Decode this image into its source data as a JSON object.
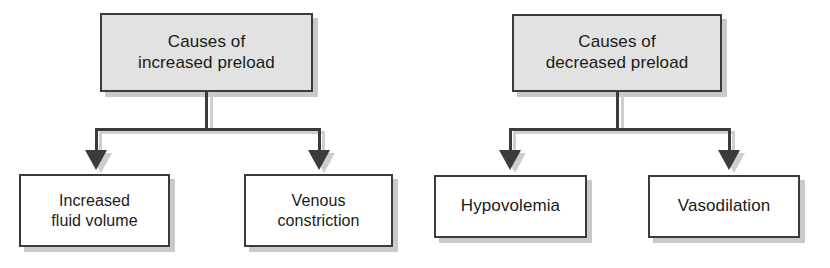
{
  "diagram": {
    "type": "flowchart",
    "orientation": "top-down",
    "style": {
      "box_border_color": "#3b3b3b",
      "root_box_fill": "#e2e2e2",
      "leaf_box_fill": "#ffffff",
      "shadow_color": "#c9c9c9",
      "connector_color": "#3b3b3b",
      "text_color": "#1a1a1a",
      "background": "#ffffff"
    },
    "charts": [
      {
        "id": "increased-preload",
        "root": {
          "id": "causes-increased-preload",
          "label": "Causes of\nincreased preload",
          "line1": "Causes of",
          "line2": "increased preload",
          "fill": "#e2e2e2"
        },
        "children": [
          {
            "id": "increased-fluid-volume",
            "label": "Increased\nfluid volume",
            "line1": "Increased",
            "line2": "fluid volume",
            "fill": "#ffffff"
          },
          {
            "id": "venous-constriction",
            "label": "Venous\nconstriction",
            "line1": "Venous",
            "line2": "constriction",
            "fill": "#ffffff"
          }
        ]
      },
      {
        "id": "decreased-preload",
        "root": {
          "id": "causes-decreased-preload",
          "label": "Causes of\ndecreased preload",
          "line1": "Causes of",
          "line2": "decreased preload",
          "fill": "#e2e2e2"
        },
        "children": [
          {
            "id": "hypovolemia",
            "label": "Hypovolemia",
            "line1": "Hypovolemia",
            "line2": "",
            "fill": "#ffffff"
          },
          {
            "id": "vasodilation",
            "label": "Vasodilation",
            "line1": "Vasodilation",
            "line2": "",
            "fill": "#ffffff"
          }
        ]
      }
    ]
  }
}
